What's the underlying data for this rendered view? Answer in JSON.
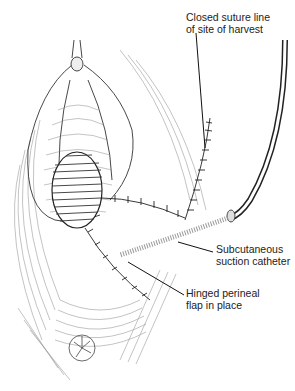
{
  "figure": {
    "labels": [
      {
        "id": "suture",
        "lines": [
          "Closed suture line",
          "of site of harvest"
        ],
        "x": 186,
        "y": 11
      },
      {
        "id": "catheter",
        "lines": [
          "Subcutaneous",
          "suction catheter"
        ],
        "x": 216,
        "y": 243
      },
      {
        "id": "flap",
        "lines": [
          "Hinged perineal",
          "flap in place"
        ],
        "x": 186,
        "y": 287
      }
    ],
    "colors": {
      "ink": "#222222",
      "hatch": "#8a8a8a",
      "background": "#ffffff"
    }
  }
}
